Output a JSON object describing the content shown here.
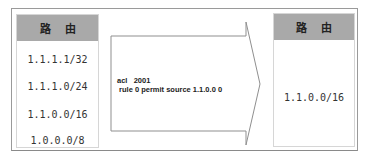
{
  "left_table": {
    "header": "路由",
    "routes": [
      "1.1.1.1/32",
      "1.1.1.0/24",
      "1.1.0.0/16",
      "1.0.0.0/8"
    ]
  },
  "arrow": {
    "line1": "acl   2001",
    "line2": " rule 0 permit source 1.1.0.0 0"
  },
  "right_table": {
    "header": "路由",
    "routes": [
      "1.1.0.0/16"
    ]
  },
  "colors": {
    "header_bg": "#a9a9a9",
    "border": "#9a9a9a"
  }
}
